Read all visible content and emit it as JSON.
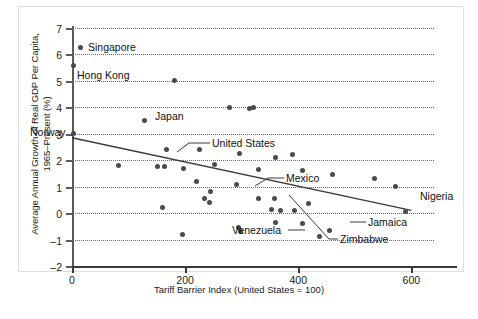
{
  "chart_data": {
    "type": "scatter",
    "title": "",
    "xlabel": "Tariff Barrier Index (United States = 100)",
    "ylabel_line1": "Average Annual Growth of Real GDP Per Capita,",
    "ylabel_line2": "1965–Present (%)",
    "xlim": [
      0,
      640
    ],
    "ylim": [
      -2,
      7
    ],
    "xticks": [
      0,
      200,
      400,
      600
    ],
    "xtick_labels": [
      "0",
      "200",
      "400",
      "600"
    ],
    "yticks": [
      -2,
      -1,
      0,
      1,
      2,
      3,
      4,
      5,
      6,
      7
    ],
    "ytick_labels": [
      "–2",
      "–1",
      "0",
      "1",
      "2",
      "3",
      "4",
      "5",
      "6",
      "7"
    ],
    "grid": "horizontal-dotted",
    "legend": "none",
    "marker_color": "#4a4a4a",
    "axis_color": "#3a3a3a",
    "grid_color": "#6b6b6b",
    "trendline": {
      "x0": 0,
      "y0": 2.85,
      "x1": 600,
      "y1": 0.1,
      "color": "#3a3a3a"
    },
    "points": [
      {
        "x": 15,
        "y": 6.25,
        "label": "Singapore"
      },
      {
        "x": 2,
        "y": 5.6,
        "label": "Hong Kong"
      },
      {
        "x": 182,
        "y": 5.0,
        "label": ""
      },
      {
        "x": 278,
        "y": 4.0,
        "label": ""
      },
      {
        "x": 313,
        "y": 3.95,
        "label": ""
      },
      {
        "x": 320,
        "y": 4.0,
        "label": ""
      },
      {
        "x": 128,
        "y": 3.5,
        "label": "Japan"
      },
      {
        "x": 2,
        "y": 3.0,
        "label": "Norway"
      },
      {
        "x": 225,
        "y": 2.4,
        "label": ""
      },
      {
        "x": 297,
        "y": 2.25,
        "label": "Mexico"
      },
      {
        "x": 167,
        "y": 2.4,
        "label": "United States"
      },
      {
        "x": 360,
        "y": 2.1,
        "label": ""
      },
      {
        "x": 390,
        "y": 2.2,
        "label": ""
      },
      {
        "x": 82,
        "y": 1.8,
        "label": ""
      },
      {
        "x": 152,
        "y": 1.75,
        "label": ""
      },
      {
        "x": 163,
        "y": 1.75,
        "label": ""
      },
      {
        "x": 198,
        "y": 1.7,
        "label": ""
      },
      {
        "x": 252,
        "y": 1.85,
        "label": ""
      },
      {
        "x": 330,
        "y": 1.65,
        "label": ""
      },
      {
        "x": 408,
        "y": 1.6,
        "label": ""
      },
      {
        "x": 460,
        "y": 1.45,
        "label": ""
      },
      {
        "x": 535,
        "y": 1.3,
        "label": ""
      },
      {
        "x": 220,
        "y": 1.2,
        "label": ""
      },
      {
        "x": 290,
        "y": 1.1,
        "label": ""
      },
      {
        "x": 244,
        "y": 0.8,
        "label": ""
      },
      {
        "x": 234,
        "y": 0.55,
        "label": ""
      },
      {
        "x": 243,
        "y": 0.4,
        "label": ""
      },
      {
        "x": 330,
        "y": 0.55,
        "label": ""
      },
      {
        "x": 160,
        "y": 0.2,
        "label": ""
      },
      {
        "x": 352,
        "y": 0.15,
        "label": ""
      },
      {
        "x": 368,
        "y": 0.1,
        "label": ""
      },
      {
        "x": 393,
        "y": 0.1,
        "label": ""
      },
      {
        "x": 418,
        "y": 0.35,
        "label": ""
      },
      {
        "x": 572,
        "y": 1.0,
        "label": ""
      },
      {
        "x": 590,
        "y": 0.05,
        "label": "Nigeria"
      },
      {
        "x": 360,
        "y": -0.35,
        "label": ""
      },
      {
        "x": 408,
        "y": -0.4,
        "label": ""
      },
      {
        "x": 295,
        "y": -0.55,
        "label": ""
      },
      {
        "x": 298,
        "y": -0.7,
        "label": ""
      },
      {
        "x": 196,
        "y": -0.8,
        "label": ""
      },
      {
        "x": 455,
        "y": -0.65,
        "label": "Jamaica"
      },
      {
        "x": 437,
        "y": -0.9,
        "label": "Venezuela"
      },
      {
        "x": 358,
        "y": 0.55,
        "label": "Zimbabwe"
      }
    ],
    "annotations": [
      {
        "text": "Singapore",
        "anchor": "right-of-point"
      },
      {
        "text": "Hong Kong",
        "anchor": "right-of-point"
      },
      {
        "text": "Japan",
        "anchor": "right-of-point"
      },
      {
        "text": "Norway",
        "anchor": "left-of-point"
      },
      {
        "text": "United States",
        "anchor": "leader-line"
      },
      {
        "text": "Mexico",
        "anchor": "leader-line"
      },
      {
        "text": "Venezuela",
        "anchor": "leader-line"
      },
      {
        "text": "Zimbabwe",
        "anchor": "leader-line"
      },
      {
        "text": "Jamaica",
        "anchor": "leader-line"
      },
      {
        "text": "Nigeria",
        "anchor": "above-point"
      }
    ],
    "annotation_labels": {
      "singapore": "Singapore",
      "hong_kong": "Hong Kong",
      "japan": "Japan",
      "norway": "Norway",
      "united_states": "United States",
      "mexico": "Mexico",
      "venezuela": "Venezuela",
      "zimbabwe": "Zimbabwe",
      "jamaica": "Jamaica",
      "nigeria": "Nigeria"
    }
  }
}
